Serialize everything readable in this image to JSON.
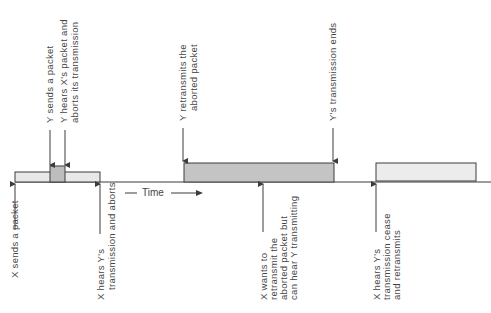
{
  "diagram": {
    "colors": {
      "line": "#3c3c3c",
      "x_packet_fill": "#e8e8e8",
      "y_packet_fill": "#bdbdbd",
      "text": "#444444"
    },
    "time_axis": {
      "label": "Time"
    },
    "packets": [
      {
        "id": "x-packet-1",
        "owner": "X",
        "x1": 15,
        "x2": 100,
        "top": 172
      },
      {
        "id": "y-packet-1",
        "owner": "Y",
        "x1": 50,
        "x2": 65,
        "top": 166
      },
      {
        "id": "y-packet-2",
        "owner": "Y",
        "x1": 184,
        "x2": 334,
        "top": 163
      },
      {
        "id": "x-packet-2",
        "owner": "X",
        "x1": 376,
        "x2": 476,
        "top": 163
      }
    ],
    "top_labels": [
      {
        "id": "y-sends",
        "lines": [
          "Y sends a packet"
        ]
      },
      {
        "id": "y-hears-aborts",
        "lines": [
          "Y hears X's packet and",
          "aborts its transmission"
        ]
      },
      {
        "id": "y-retransmits",
        "lines": [
          "Y retransmits the",
          "aborted packet"
        ]
      },
      {
        "id": "y-ends",
        "lines": [
          "Y's transmission ends"
        ]
      }
    ],
    "bottom_labels": [
      {
        "id": "x-sends",
        "lines": [
          "X sends a packet"
        ]
      },
      {
        "id": "x-hears-aborts",
        "lines": [
          "X hears Y's",
          "transmission and aborts"
        ]
      },
      {
        "id": "x-wants",
        "lines": [
          "X wants to",
          "retransmit the",
          "aborted packet but",
          "can hear Y transmitting"
        ]
      },
      {
        "id": "x-hears-cease",
        "lines": [
          "X hears Y's",
          "transmission cease",
          "and retransmits"
        ]
      }
    ]
  }
}
